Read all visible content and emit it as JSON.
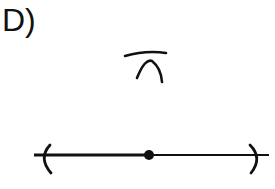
{
  "label": "D)",
  "diagram": {
    "type": "compass-construction",
    "stroke_color": "#111111",
    "background": "#ffffff",
    "line": {
      "x1": 34,
      "x2": 269,
      "y": 155
    },
    "point": {
      "cx": 149,
      "cy": 155,
      "r": 5
    },
    "base_arcs": [
      "left",
      "right"
    ],
    "upper_arcs_intersection": {
      "x": 147,
      "y": 58
    }
  }
}
